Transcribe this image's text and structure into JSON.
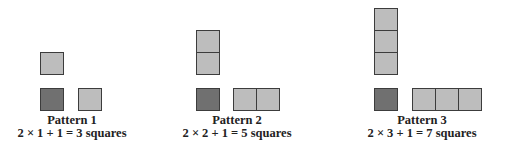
{
  "colors": {
    "light_square": "#bdbdbd",
    "dark_square": "#707070",
    "border": "#3c3c3c",
    "text": "#222222"
  },
  "patterns": [
    {
      "title": "Pattern 1",
      "equation": "2 × 1 + 1 = 3 squares",
      "n": 1
    },
    {
      "title": "Pattern 2",
      "equation": "2 × 2 + 1 = 5 squares",
      "n": 2
    },
    {
      "title": "Pattern 3",
      "equation": "2 × 3 + 1 = 7 squares",
      "n": 3
    }
  ]
}
